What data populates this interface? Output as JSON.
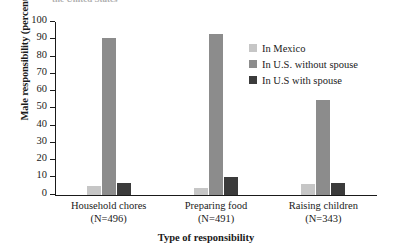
{
  "chart_data": {
    "type": "bar",
    "title": "the United States",
    "xlabel": "Type of responsibility",
    "ylabel": "Male responsibility (percent)",
    "categories": [
      "Household chores",
      "Preparing food",
      "Raising children"
    ],
    "category_counts": [
      "(N=496)",
      "(N=491)",
      "(N=343)"
    ],
    "series": [
      {
        "name": "In Mexico",
        "color": "#c6c6c6",
        "values": [
          5,
          4,
          6
        ]
      },
      {
        "name": "In U.S. without spouse",
        "color": "#8c8c8c",
        "values": [
          91,
          93,
          55
        ]
      },
      {
        "name": "In U.S with spouse",
        "color": "#3b3b3b",
        "values": [
          7,
          10,
          7
        ]
      }
    ],
    "ylim": [
      0,
      100
    ],
    "yticks": [
      0,
      10,
      20,
      30,
      40,
      50,
      60,
      70,
      80,
      90,
      100
    ],
    "ytick_labels": [
      "0",
      "10",
      "20",
      "30",
      "40",
      "50",
      "60",
      "70",
      "80",
      "90",
      "100"
    ],
    "grid": false,
    "legend_position": "upper right"
  }
}
